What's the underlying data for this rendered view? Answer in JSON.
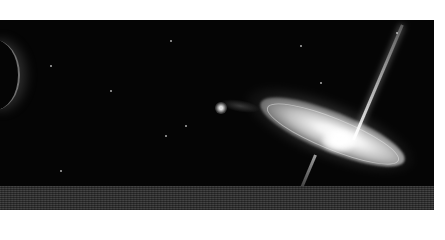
{
  "image": {
    "subject": "spiral galaxy with bipolar jet above planetary horizon",
    "colors": {
      "background": "#ffffff",
      "space": "#050505",
      "ground": "#333333",
      "glow": "#ffffff"
    }
  }
}
